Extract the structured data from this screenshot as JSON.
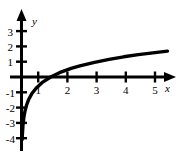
{
  "chart_data": {
    "type": "line",
    "title": "",
    "xlabel": "x",
    "ylabel": "y",
    "xlim": [
      -0.1,
      5.4
    ],
    "ylim": [
      -4.6,
      3.6
    ],
    "grid": false,
    "legend": null,
    "x_ticks": [
      1,
      2,
      3,
      4,
      5
    ],
    "x_tick_labels": [
      "1",
      "2",
      "3",
      "4",
      "5"
    ],
    "y_ticks": [
      3,
      2,
      1,
      -1,
      -2,
      -3,
      -4
    ],
    "y_tick_labels": [
      "3",
      "2",
      "1",
      "-1",
      "-2",
      "-3",
      "-4"
    ],
    "series": [
      {
        "name": "y = ln(x)",
        "x": [
          0.02,
          0.05,
          0.08,
          0.12,
          0.18,
          0.25,
          0.35,
          0.5,
          0.7,
          1.0,
          1.3,
          1.7,
          2.0,
          2.5,
          3.0,
          3.5,
          4.0,
          4.5,
          5.0
        ],
        "y": [
          -4.1,
          -3.15,
          -2.65,
          -2.22,
          -1.8,
          -1.45,
          -1.1,
          -0.73,
          -0.37,
          0.0,
          0.28,
          0.56,
          0.73,
          0.96,
          1.15,
          1.32,
          1.46,
          1.58,
          1.69
        ]
      }
    ],
    "axis_style": {
      "color": "#000000",
      "arrowheads": true,
      "tick_marks": true
    }
  },
  "labels": {
    "x_axis_name": "x",
    "y_axis_name": "y"
  }
}
